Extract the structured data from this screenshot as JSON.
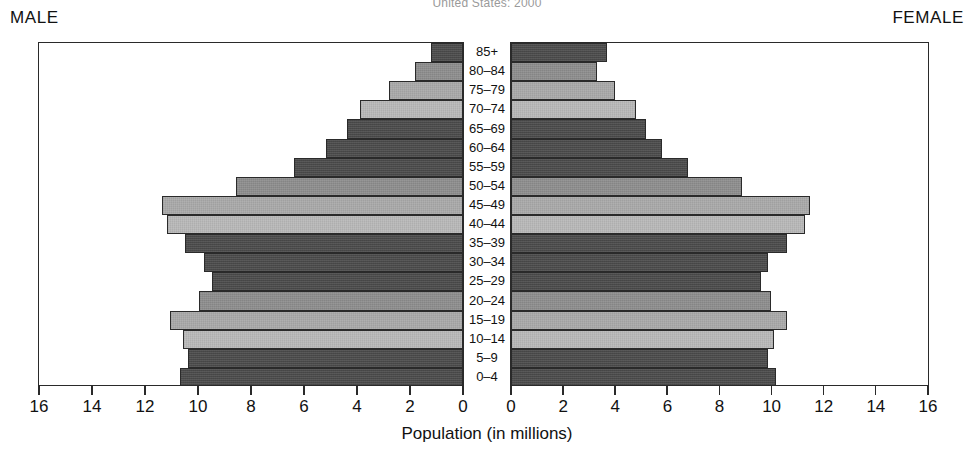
{
  "title": "United States: 2000",
  "captions": {
    "male": "MALE",
    "female": "FEMALE"
  },
  "axis": {
    "title": "Population (in millions)",
    "male_ticks": [
      "16",
      "14",
      "12",
      "10",
      "8",
      "6",
      "4",
      "2",
      "0"
    ],
    "female_ticks": [
      "0",
      "2",
      "4",
      "6",
      "8",
      "10",
      "12",
      "14",
      "16"
    ]
  },
  "colors": {
    "frame": "#2a2a2a",
    "tone_dark": "#4a4a4a",
    "tone_mid": "#8d8d8d",
    "tone_light": "#a9a9a9",
    "tone_pale": "#b8b8b8",
    "background": "#ffffff"
  },
  "chart_data": {
    "type": "bar",
    "subtype": "population-pyramid",
    "title": "United States: 2000",
    "xlabel": "Population (in millions)",
    "ylabel": "",
    "xlim": [
      0,
      16
    ],
    "grid": false,
    "legend": "none",
    "categories": [
      "85+",
      "80–84",
      "75–79",
      "70–74",
      "65–69",
      "60–64",
      "55–59",
      "50–54",
      "45–49",
      "40–44",
      "35–39",
      "30–34",
      "25–29",
      "20–24",
      "15–19",
      "10–14",
      "5–9",
      "0–4"
    ],
    "series": [
      {
        "name": "MALE",
        "direction": "left",
        "values": [
          1.2,
          1.8,
          2.8,
          3.9,
          4.4,
          5.2,
          6.4,
          8.6,
          11.4,
          11.2,
          10.5,
          9.8,
          9.5,
          10.0,
          11.1,
          10.6,
          10.4,
          10.7
        ]
      },
      {
        "name": "FEMALE",
        "direction": "right",
        "values": [
          3.7,
          3.3,
          4.0,
          4.8,
          5.2,
          5.8,
          6.8,
          8.9,
          11.5,
          11.3,
          10.6,
          9.9,
          9.6,
          10.0,
          10.6,
          10.1,
          9.9,
          10.2
        ]
      }
    ],
    "tones": [
      "dark",
      "mid",
      "light",
      "pale",
      "dark",
      "dark",
      "dark",
      "mid",
      "light",
      "pale",
      "dark",
      "dark",
      "dark",
      "mid",
      "light",
      "pale",
      "dark",
      "dark"
    ]
  }
}
